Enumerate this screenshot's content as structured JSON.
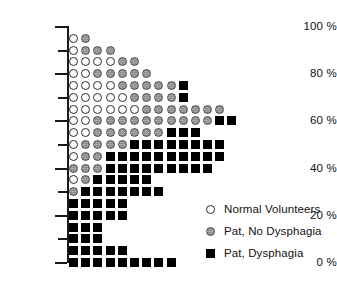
{
  "chart_data": {
    "type": "scatter",
    "plot_style": "stacked dot plot / categorical dot matrix",
    "title": "",
    "xlabel": "",
    "ylabel": "",
    "ylim": [
      0,
      100
    ],
    "y_tick_labels": [
      "100 %",
      "80 %",
      "60 %",
      "40 %",
      "20 %",
      "0 %"
    ],
    "y_tick_values": [
      100,
      80,
      60,
      40,
      20,
      0
    ],
    "y_minor_ticks": [
      90,
      70,
      50,
      30,
      10
    ],
    "grid": false,
    "legend_position": "lower right",
    "series": [
      {
        "name": "Normal Volunteers",
        "marker": "open-circle",
        "color": "#ffffff",
        "edge": "#2b2b2b",
        "total": 40
      },
      {
        "name": "Pat, No Dysphagia",
        "marker": "gray-circle",
        "color": "#9a9a9a",
        "edge": "#4a4a4a",
        "total": 70
      },
      {
        "name": "Pat, Dysphagia",
        "marker": "black-square",
        "color": "#000000",
        "edge": "#000000",
        "total": 99
      }
    ],
    "rows": [
      {
        "y": 95,
        "counts": {
          "normal": 1,
          "no_dysphagia": 1,
          "dysphagia": 0
        }
      },
      {
        "y": 90,
        "counts": {
          "normal": 1,
          "no_dysphagia": 3,
          "dysphagia": 0
        }
      },
      {
        "y": 85,
        "counts": {
          "normal": 4,
          "no_dysphagia": 2,
          "dysphagia": 0
        }
      },
      {
        "y": 80,
        "counts": {
          "normal": 2,
          "no_dysphagia": 5,
          "dysphagia": 0
        }
      },
      {
        "y": 75,
        "counts": {
          "normal": 4,
          "no_dysphagia": 5,
          "dysphagia": 1
        }
      },
      {
        "y": 70,
        "counts": {
          "normal": 5,
          "no_dysphagia": 4,
          "dysphagia": 1
        }
      },
      {
        "y": 65,
        "counts": {
          "normal": 6,
          "no_dysphagia": 7,
          "dysphagia": 0
        }
      },
      {
        "y": 60,
        "counts": {
          "normal": 2,
          "no_dysphagia": 10,
          "dysphagia": 2
        }
      },
      {
        "y": 55,
        "counts": {
          "normal": 2,
          "no_dysphagia": 6,
          "dysphagia": 3
        }
      },
      {
        "y": 50,
        "counts": {
          "normal": 1,
          "no_dysphagia": 4,
          "dysphagia": 8
        }
      },
      {
        "y": 45,
        "counts": {
          "normal": 1,
          "no_dysphagia": 2,
          "dysphagia": 10
        }
      },
      {
        "y": 40,
        "counts": {
          "normal": 0,
          "no_dysphagia": 3,
          "dysphagia": 9
        }
      },
      {
        "y": 35,
        "counts": {
          "normal": 1,
          "no_dysphagia": 1,
          "dysphagia": 5
        }
      },
      {
        "y": 30,
        "counts": {
          "normal": 0,
          "no_dysphagia": 1,
          "dysphagia": 7
        }
      },
      {
        "y": 25,
        "counts": {
          "normal": 0,
          "no_dysphagia": 0,
          "dysphagia": 5
        }
      },
      {
        "y": 20,
        "counts": {
          "normal": 0,
          "no_dysphagia": 0,
          "dysphagia": 5
        }
      },
      {
        "y": 15,
        "counts": {
          "normal": 0,
          "no_dysphagia": 0,
          "dysphagia": 3
        }
      },
      {
        "y": 10,
        "counts": {
          "normal": 0,
          "no_dysphagia": 0,
          "dysphagia": 3
        }
      },
      {
        "y": 5,
        "counts": {
          "normal": 0,
          "no_dysphagia": 0,
          "dysphagia": 5
        }
      },
      {
        "y": 0,
        "counts": {
          "normal": 0,
          "no_dysphagia": 0,
          "dysphagia": 9
        }
      }
    ]
  },
  "axis": {
    "ticks": [
      {
        "label": "100 %",
        "value": 100,
        "major": true
      },
      {
        "label": "",
        "value": 90,
        "major": false
      },
      {
        "label": "80 %",
        "value": 80,
        "major": true
      },
      {
        "label": "",
        "value": 70,
        "major": false
      },
      {
        "label": "60 %",
        "value": 60,
        "major": true
      },
      {
        "label": "",
        "value": 50,
        "major": false
      },
      {
        "label": "40 %",
        "value": 40,
        "major": true
      },
      {
        "label": "",
        "value": 30,
        "major": false
      },
      {
        "label": "20 %",
        "value": 20,
        "major": true
      },
      {
        "label": "",
        "value": 10,
        "major": false
      },
      {
        "label": "0 %",
        "value": 0,
        "major": true
      }
    ]
  },
  "legend": {
    "items": [
      {
        "label": "Normal Volunteers",
        "marker": "open-circle"
      },
      {
        "label": "Pat, No Dysphagia",
        "marker": "gray-circle"
      },
      {
        "label": "Pat, Dysphagia",
        "marker": "black-square"
      }
    ]
  }
}
